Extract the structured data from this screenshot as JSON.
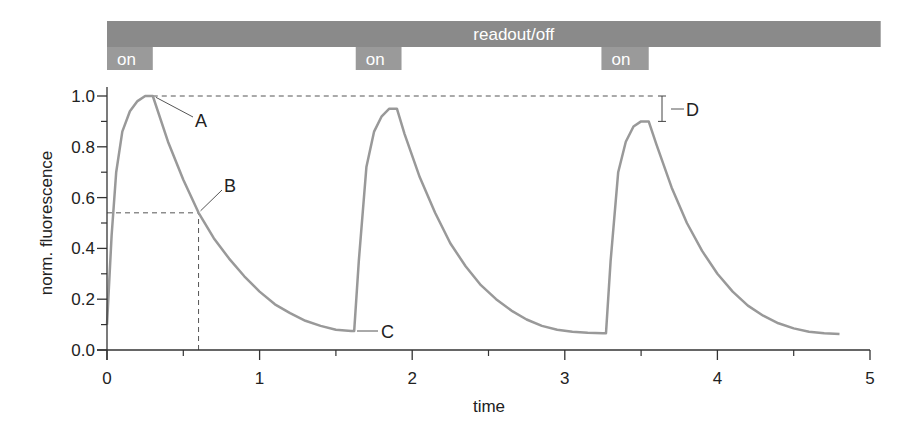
{
  "chart_data": {
    "type": "line",
    "title": "",
    "xlabel": "time",
    "ylabel": "norm. fluorescence",
    "xlim": [
      0,
      5
    ],
    "ylim": [
      0,
      1.05
    ],
    "x_ticks": [
      "0",
      "1",
      "2",
      "3",
      "4",
      "5"
    ],
    "x_minor_ticks": [
      0.5,
      1.5,
      2.5,
      3.5,
      4.5
    ],
    "y_ticks": [
      "0.0",
      "0.2",
      "0.4",
      "0.6",
      "0.8",
      "1.0"
    ],
    "y_minor_ticks": [
      0.1,
      0.3,
      0.5,
      0.7,
      0.9
    ],
    "grid": false,
    "legend": null,
    "series": [
      {
        "name": "fluorescence",
        "color": "#999999",
        "x": [
          0.0,
          0.03,
          0.06,
          0.1,
          0.15,
          0.2,
          0.25,
          0.3,
          0.4,
          0.5,
          0.6,
          0.7,
          0.8,
          0.9,
          1.0,
          1.1,
          1.2,
          1.3,
          1.4,
          1.5,
          1.6,
          1.62,
          1.65,
          1.7,
          1.75,
          1.8,
          1.85,
          1.9,
          1.95,
          2.05,
          2.15,
          2.25,
          2.35,
          2.45,
          2.55,
          2.65,
          2.75,
          2.85,
          2.95,
          3.05,
          3.15,
          3.25,
          3.27,
          3.3,
          3.35,
          3.4,
          3.45,
          3.5,
          3.55,
          3.6,
          3.7,
          3.8,
          3.9,
          4.0,
          4.1,
          4.2,
          4.3,
          4.4,
          4.5,
          4.6,
          4.7,
          4.8
        ],
        "y": [
          0.1,
          0.45,
          0.7,
          0.86,
          0.94,
          0.98,
          1.0,
          1.0,
          0.82,
          0.67,
          0.54,
          0.44,
          0.36,
          0.29,
          0.23,
          0.18,
          0.145,
          0.115,
          0.095,
          0.08,
          0.075,
          0.075,
          0.35,
          0.72,
          0.86,
          0.92,
          0.95,
          0.95,
          0.85,
          0.68,
          0.54,
          0.42,
          0.33,
          0.255,
          0.2,
          0.155,
          0.12,
          0.095,
          0.08,
          0.072,
          0.068,
          0.066,
          0.066,
          0.35,
          0.7,
          0.82,
          0.88,
          0.9,
          0.9,
          0.81,
          0.64,
          0.5,
          0.39,
          0.3,
          0.23,
          0.175,
          0.135,
          0.105,
          0.085,
          0.072,
          0.066,
          0.063
        ]
      }
    ],
    "reference_lines": [
      {
        "type": "horizontal-dashed",
        "y": 1.0,
        "x_from": 0.3,
        "x_to": 3.6
      },
      {
        "type": "horizontal-dashed",
        "y": 0.54,
        "x_from": 0,
        "x_to": 0.6
      },
      {
        "type": "vertical-dashed",
        "x": 0.6,
        "y_from": 0,
        "y_to": 0.54
      }
    ],
    "annotations": [
      {
        "label": "A",
        "x": 0.3,
        "y": 1.0,
        "description": "peak of first pulse"
      },
      {
        "label": "B",
        "x": 0.6,
        "y": 0.54,
        "description": "point on decay"
      },
      {
        "label": "C",
        "x": 1.62,
        "y": 0.075,
        "description": "minimum before second pulse"
      },
      {
        "label": "D",
        "x": 3.6,
        "y_from": 0.9,
        "y_to": 1.0,
        "description": "difference between first and third peak"
      }
    ],
    "timeline": {
      "readout_bar": {
        "label": "readout/off",
        "x_from": 0,
        "x_to": 5.07
      },
      "on_pulses": [
        {
          "label": "on",
          "x_from": 0,
          "x_to": 0.3
        },
        {
          "label": "on",
          "x_from": 1.63,
          "x_to": 1.93
        },
        {
          "label": "on",
          "x_from": 3.24,
          "x_to": 3.55
        }
      ]
    }
  },
  "colors": {
    "bar": "#8a8a8a",
    "on_box": "#9a9a9a",
    "curve": "#999999",
    "axis": "#333333",
    "dashed": "#555555"
  }
}
